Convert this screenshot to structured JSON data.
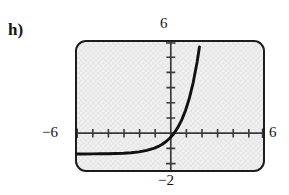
{
  "figure": {
    "part_label": "h)",
    "labels": {
      "top": "6",
      "left": "−6",
      "right": "6",
      "bottom": "−2"
    },
    "colors": {
      "screen_fill": "#e7e7e7",
      "frame_border": "#1d1d1d",
      "curve": "#111111",
      "axis": "#3a3a3a",
      "text": "#161616",
      "page_background": "#ffffff"
    }
  },
  "chart_data": {
    "type": "line",
    "title": "",
    "subtitle": "",
    "xlabel": "",
    "ylabel": "",
    "xlim": [
      -6,
      6
    ],
    "ylim": [
      -2,
      6
    ],
    "grid": false,
    "legend": null,
    "axis_tick_labels": {
      "x_min": "−6",
      "x_max": "6",
      "y_max": "6",
      "y_min": "−2"
    },
    "x_tick_spacing": 1,
    "y_tick_spacing": 1,
    "annotations": [],
    "series": [
      {
        "name": "y = e^x - 1",
        "x": [
          -6.0,
          -5.5,
          -5.0,
          -4.5,
          -4.0,
          -3.5,
          -3.0,
          -2.5,
          -2.0,
          -1.5,
          -1.0,
          -0.75,
          -0.5,
          -0.25,
          0.0,
          0.25,
          0.5,
          0.75,
          1.0,
          1.25,
          1.5,
          1.75,
          1.9
        ],
        "y": [
          -0.9975,
          -0.9959,
          -0.9933,
          -0.9889,
          -0.9817,
          -0.9698,
          -0.9502,
          -0.9179,
          -0.8647,
          -0.7769,
          -0.6321,
          -0.5276,
          -0.3935,
          -0.2212,
          0.0,
          0.284,
          0.6487,
          1.117,
          1.7183,
          2.4903,
          3.4817,
          4.7546,
          5.6859
        ]
      }
    ]
  }
}
